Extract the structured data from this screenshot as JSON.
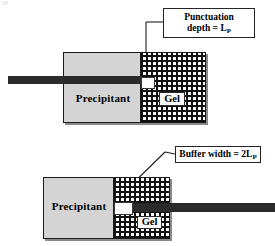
{
  "figure": {
    "colors": {
      "precipitant_fill": "#d4d4d4",
      "gel_hatch": "#111111",
      "needle": "#2b2b2b",
      "outline": "#1a1a1a",
      "void": "#ffffff",
      "shadow": "#8a8a8a"
    }
  },
  "top_panel": {
    "callout": {
      "line1": "Punctuation",
      "line2_prefix": "depth = L",
      "line2_sub": "P"
    },
    "precipitant_label": "Precipitant",
    "gel_label": "Gel",
    "needle_direction": "enters from left",
    "void_name": "punctuation-void"
  },
  "bottom_panel": {
    "callout": {
      "line1_prefix": "Buffer width = 2L",
      "line1_sub": "P"
    },
    "precipitant_label": "Precipitant",
    "gel_label": "Gel",
    "needle_direction": "enters from right",
    "void_name": "buffer-void"
  },
  "caption_strip": {
    "text": ""
  }
}
